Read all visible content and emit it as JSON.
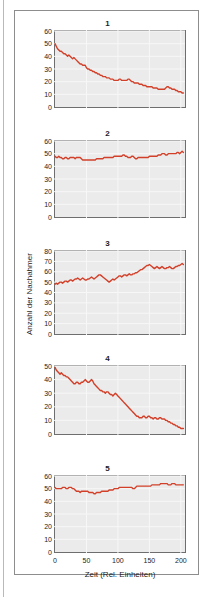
{
  "figure": {
    "ylabel": "Anzahl der Nachahmer",
    "xlabel": "Zeit (Rel. Einheiten)",
    "line_color": "#d2402a",
    "plot_background": "#ebebeb",
    "grid_color": "#f7f7f7",
    "axis_color": "#6e6e6e"
  },
  "chart_data": [
    {
      "type": "line",
      "title": "1",
      "xlabel": "",
      "ylabel": "",
      "xlim": [
        0,
        205
      ],
      "ylim": [
        0,
        60
      ],
      "yticks": [
        0,
        10,
        20,
        30,
        40,
        50,
        60
      ],
      "xticks": [
        0,
        50,
        100,
        150,
        200
      ],
      "grid": true,
      "legend": "none",
      "series": [
        {
          "name": "Nachahmer",
          "x": [
            0,
            2,
            4,
            6,
            8,
            10,
            12,
            14,
            16,
            18,
            20,
            22,
            24,
            26,
            28,
            30,
            32,
            34,
            36,
            38,
            40,
            42,
            44,
            46,
            48,
            50,
            52,
            54,
            56,
            58,
            60,
            62,
            64,
            66,
            68,
            70,
            72,
            74,
            76,
            78,
            80,
            82,
            84,
            86,
            88,
            90,
            92,
            94,
            96,
            98,
            100,
            102,
            104,
            106,
            108,
            110,
            112,
            114,
            116,
            118,
            120,
            122,
            124,
            126,
            128,
            130,
            132,
            134,
            136,
            138,
            140,
            142,
            144,
            146,
            148,
            150,
            152,
            154,
            156,
            158,
            160,
            162,
            164,
            166,
            168,
            170,
            172,
            174,
            176,
            178,
            180,
            182,
            184,
            186,
            188,
            190,
            192,
            194,
            196,
            198,
            200,
            202,
            204
          ],
          "y": [
            50,
            48,
            46,
            45,
            44,
            44,
            43,
            42,
            42,
            41,
            40,
            41,
            40,
            39,
            38,
            39,
            38,
            37,
            36,
            35,
            34,
            34,
            33,
            33,
            33,
            31,
            30,
            30,
            29,
            29,
            28,
            28,
            27,
            27,
            26,
            26,
            25,
            25,
            24,
            24,
            24,
            23,
            23,
            23,
            22,
            22,
            22,
            21,
            21,
            21,
            21,
            22,
            22,
            21,
            21,
            21,
            21,
            21,
            22,
            22,
            21,
            20,
            20,
            19,
            19,
            19,
            19,
            18,
            18,
            18,
            17,
            17,
            17,
            16,
            16,
            16,
            16,
            16,
            15,
            15,
            15,
            15,
            14,
            14,
            14,
            14,
            14,
            14,
            15,
            16,
            16,
            15,
            15,
            14,
            14,
            14,
            13,
            13,
            12,
            12,
            12,
            11,
            11
          ]
        }
      ]
    },
    {
      "type": "line",
      "title": "2",
      "xlabel": "",
      "ylabel": "",
      "xlim": [
        0,
        205
      ],
      "ylim": [
        0,
        60
      ],
      "yticks": [
        0,
        10,
        20,
        30,
        40,
        50,
        60
      ],
      "xticks": [
        0,
        50,
        100,
        150,
        200
      ],
      "grid": true,
      "legend": "none",
      "series": [
        {
          "name": "Nachahmer",
          "x": [
            0,
            2,
            4,
            6,
            8,
            10,
            12,
            14,
            16,
            18,
            20,
            22,
            24,
            26,
            28,
            30,
            32,
            34,
            36,
            38,
            40,
            42,
            44,
            46,
            48,
            50,
            52,
            54,
            56,
            58,
            60,
            62,
            64,
            66,
            68,
            70,
            72,
            74,
            76,
            78,
            80,
            82,
            84,
            86,
            88,
            90,
            92,
            94,
            96,
            98,
            100,
            102,
            104,
            106,
            108,
            110,
            112,
            114,
            116,
            118,
            120,
            122,
            124,
            126,
            128,
            130,
            132,
            134,
            136,
            138,
            140,
            142,
            144,
            146,
            148,
            150,
            152,
            154,
            156,
            158,
            160,
            162,
            164,
            166,
            168,
            170,
            172,
            174,
            176,
            178,
            180,
            182,
            184,
            186,
            188,
            190,
            192,
            194,
            196,
            198,
            200,
            202,
            204
          ],
          "y": [
            48,
            47,
            47,
            48,
            47,
            47,
            46,
            46,
            47,
            47,
            46,
            46,
            47,
            47,
            47,
            47,
            46,
            47,
            47,
            47,
            47,
            46,
            45,
            45,
            45,
            45,
            45,
            45,
            45,
            45,
            45,
            45,
            45,
            46,
            46,
            46,
            46,
            46,
            46,
            47,
            47,
            47,
            47,
            47,
            47,
            47,
            47,
            48,
            48,
            48,
            48,
            48,
            48,
            48,
            49,
            49,
            48,
            48,
            47,
            47,
            47,
            48,
            48,
            47,
            46,
            46,
            47,
            47,
            47,
            47,
            47,
            47,
            47,
            47,
            47,
            48,
            48,
            48,
            48,
            48,
            48,
            48,
            49,
            49,
            49,
            50,
            50,
            50,
            49,
            49,
            50,
            50,
            50,
            50,
            50,
            50,
            50,
            51,
            51,
            50,
            51,
            52,
            51
          ]
        }
      ]
    },
    {
      "type": "line",
      "title": "3",
      "xlabel": "",
      "ylabel": "Anzahl der Nachahmer",
      "xlim": [
        0,
        205
      ],
      "ylim": [
        0,
        80
      ],
      "yticks": [
        0,
        10,
        20,
        30,
        40,
        50,
        60,
        70,
        80
      ],
      "xticks": [
        0,
        50,
        100,
        150,
        200
      ],
      "grid": true,
      "legend": "none",
      "series": [
        {
          "name": "Nachahmer",
          "x": [
            0,
            2,
            4,
            6,
            8,
            10,
            12,
            14,
            16,
            18,
            20,
            22,
            24,
            26,
            28,
            30,
            32,
            34,
            36,
            38,
            40,
            42,
            44,
            46,
            48,
            50,
            52,
            54,
            56,
            58,
            60,
            62,
            64,
            66,
            68,
            70,
            72,
            74,
            76,
            78,
            80,
            82,
            84,
            86,
            88,
            90,
            92,
            94,
            96,
            98,
            100,
            102,
            104,
            106,
            108,
            110,
            112,
            114,
            116,
            118,
            120,
            122,
            124,
            126,
            128,
            130,
            132,
            134,
            136,
            138,
            140,
            142,
            144,
            146,
            148,
            150,
            152,
            154,
            156,
            158,
            160,
            162,
            164,
            166,
            168,
            170,
            172,
            174,
            176,
            178,
            180,
            182,
            184,
            186,
            188,
            190,
            192,
            194,
            196,
            198,
            200,
            202,
            204
          ],
          "y": [
            48,
            49,
            48,
            49,
            50,
            50,
            49,
            50,
            51,
            51,
            50,
            51,
            52,
            52,
            51,
            52,
            53,
            53,
            54,
            53,
            52,
            53,
            54,
            53,
            52,
            52,
            53,
            53,
            54,
            55,
            54,
            53,
            54,
            55,
            56,
            57,
            57,
            56,
            55,
            54,
            53,
            52,
            51,
            50,
            51,
            52,
            53,
            52,
            53,
            54,
            55,
            56,
            56,
            55,
            56,
            57,
            57,
            56,
            57,
            58,
            57,
            57,
            58,
            58,
            59,
            59,
            60,
            61,
            62,
            62,
            63,
            64,
            65,
            66,
            66,
            67,
            66,
            65,
            64,
            63,
            64,
            65,
            64,
            63,
            64,
            65,
            64,
            63,
            63,
            64,
            64,
            65,
            64,
            63,
            63,
            64,
            65,
            65,
            66,
            66,
            67,
            68,
            67
          ]
        }
      ]
    },
    {
      "type": "line",
      "title": "4",
      "xlabel": "",
      "ylabel": "",
      "xlim": [
        0,
        205
      ],
      "ylim": [
        0,
        50
      ],
      "yticks": [
        0,
        10,
        20,
        30,
        40,
        50
      ],
      "xticks": [
        0,
        50,
        100,
        150,
        200
      ],
      "grid": true,
      "legend": "none",
      "series": [
        {
          "name": "Nachahmer",
          "x": [
            0,
            2,
            4,
            6,
            8,
            10,
            12,
            14,
            16,
            18,
            20,
            22,
            24,
            26,
            28,
            30,
            32,
            34,
            36,
            38,
            40,
            42,
            44,
            46,
            48,
            50,
            52,
            54,
            56,
            58,
            60,
            62,
            64,
            66,
            68,
            70,
            72,
            74,
            76,
            78,
            80,
            82,
            84,
            86,
            88,
            90,
            92,
            94,
            96,
            98,
            100,
            102,
            104,
            106,
            108,
            110,
            112,
            114,
            116,
            118,
            120,
            122,
            124,
            126,
            128,
            130,
            132,
            134,
            136,
            138,
            140,
            142,
            144,
            146,
            148,
            150,
            152,
            154,
            156,
            158,
            160,
            162,
            164,
            166,
            168,
            170,
            172,
            174,
            176,
            178,
            180,
            182,
            184,
            186,
            188,
            190,
            192,
            194,
            196,
            198,
            200,
            202,
            204
          ],
          "y": [
            49,
            47,
            46,
            45,
            44,
            45,
            44,
            43,
            43,
            42,
            42,
            41,
            40,
            39,
            38,
            37,
            37,
            38,
            38,
            37,
            37,
            38,
            38,
            39,
            40,
            39,
            38,
            38,
            39,
            40,
            39,
            37,
            36,
            35,
            34,
            33,
            32,
            32,
            31,
            31,
            30,
            31,
            31,
            30,
            29,
            29,
            28,
            29,
            30,
            29,
            28,
            27,
            26,
            25,
            24,
            23,
            22,
            21,
            20,
            19,
            18,
            17,
            16,
            15,
            14,
            13,
            13,
            12,
            12,
            12,
            13,
            13,
            12,
            12,
            13,
            13,
            12,
            12,
            11,
            12,
            12,
            11,
            11,
            12,
            12,
            11,
            11,
            11,
            10,
            10,
            9,
            9,
            8,
            8,
            7,
            7,
            6,
            6,
            5,
            5,
            4,
            4,
            4
          ]
        }
      ]
    },
    {
      "type": "line",
      "title": "5",
      "xlabel": "Zeit (Rel. Einheiten)",
      "ylabel": "",
      "xlim": [
        0,
        205
      ],
      "ylim": [
        0,
        60
      ],
      "yticks": [
        0,
        10,
        20,
        30,
        40,
        50,
        60
      ],
      "xticks": [
        0,
        50,
        100,
        150,
        200
      ],
      "grid": true,
      "legend": "none",
      "series": [
        {
          "name": "Nachahmer",
          "x": [
            0,
            2,
            4,
            6,
            8,
            10,
            12,
            14,
            16,
            18,
            20,
            22,
            24,
            26,
            28,
            30,
            32,
            34,
            36,
            38,
            40,
            42,
            44,
            46,
            48,
            50,
            52,
            54,
            56,
            58,
            60,
            62,
            64,
            66,
            68,
            70,
            72,
            74,
            76,
            78,
            80,
            82,
            84,
            86,
            88,
            90,
            92,
            94,
            96,
            98,
            100,
            102,
            104,
            106,
            108,
            110,
            112,
            114,
            116,
            118,
            120,
            122,
            124,
            126,
            128,
            130,
            132,
            134,
            136,
            138,
            140,
            142,
            144,
            146,
            148,
            150,
            152,
            154,
            156,
            158,
            160,
            162,
            164,
            166,
            168,
            170,
            172,
            174,
            176,
            178,
            180,
            182,
            184,
            186,
            188,
            190,
            192,
            194,
            196,
            198,
            200,
            202,
            204
          ],
          "y": [
            51,
            50,
            50,
            50,
            50,
            50,
            51,
            51,
            51,
            50,
            50,
            51,
            51,
            51,
            50,
            50,
            49,
            48,
            48,
            48,
            47,
            48,
            48,
            48,
            48,
            48,
            48,
            47,
            47,
            47,
            47,
            46,
            46,
            47,
            47,
            47,
            47,
            48,
            48,
            48,
            48,
            48,
            48,
            49,
            49,
            49,
            49,
            50,
            50,
            50,
            50,
            51,
            51,
            51,
            51,
            51,
            51,
            51,
            51,
            51,
            51,
            51,
            50,
            50,
            51,
            52,
            52,
            52,
            52,
            52,
            52,
            52,
            52,
            52,
            52,
            52,
            52,
            53,
            53,
            53,
            53,
            53,
            53,
            53,
            54,
            54,
            54,
            54,
            54,
            54,
            53,
            53,
            53,
            54,
            54,
            54,
            53,
            53,
            53,
            53,
            53,
            53,
            53
          ]
        }
      ]
    }
  ]
}
